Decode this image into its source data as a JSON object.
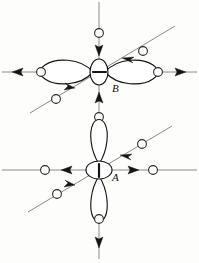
{
  "figure": {
    "background_color": "#fdfdfc",
    "width": 199,
    "height": 263,
    "line_color": "#8a8a8a",
    "ink_color": "#151515",
    "node_fill": "#fdfdfc"
  },
  "atoms": [
    {
      "id": "B",
      "label": "B",
      "label_x": 112,
      "label_y": 92,
      "center_x": 99,
      "center_y": 72,
      "orbital_orientation": "horizontal",
      "core_ellipse_rx": 9,
      "core_ellipse_ry": 13
    },
    {
      "id": "A",
      "label": "A",
      "label_x": 112,
      "label_y": 181,
      "center_x": 99,
      "center_y": 170,
      "orbital_orientation": "vertical",
      "core_ellipse_rx": 13,
      "core_ellipse_ry": 9
    }
  ],
  "axes": [
    {
      "atom": "B",
      "name": "horizontal-axis",
      "x1": 2,
      "y1": 72,
      "x2": 197,
      "y2": 72
    },
    {
      "atom": "B",
      "name": "vertical-axis",
      "x1": 99,
      "y1": 2,
      "x2": 99,
      "y2": 133
    },
    {
      "atom": "B",
      "name": "diagonal-axis",
      "x1": 30,
      "y1": 113,
      "x2": 175,
      "y2": 26
    },
    {
      "atom": "A",
      "name": "horizontal-axis",
      "x1": 2,
      "y1": 170,
      "x2": 197,
      "y2": 170
    },
    {
      "atom": "A",
      "name": "vertical-axis",
      "x1": 99,
      "y1": 126,
      "x2": 99,
      "y2": 259
    },
    {
      "atom": "A",
      "name": "diagonal-axis",
      "x1": 28,
      "y1": 212,
      "x2": 172,
      "y2": 126
    }
  ],
  "arrows": [
    {
      "atom": "B",
      "name": "arrow-left-outward",
      "direction": "left",
      "sense": "outward",
      "tip_x": 12,
      "tip_y": 72,
      "angle_deg": 180
    },
    {
      "atom": "B",
      "name": "arrow-right-outward",
      "direction": "right",
      "sense": "outward",
      "tip_x": 186,
      "tip_y": 72,
      "angle_deg": 0
    },
    {
      "atom": "B",
      "name": "arrow-top-inward",
      "direction": "down",
      "sense": "inward",
      "tip_x": 99,
      "tip_y": 56,
      "angle_deg": 90
    },
    {
      "atom": "B",
      "name": "arrow-bottom-inward",
      "direction": "up",
      "sense": "inward",
      "tip_x": 99,
      "tip_y": 92,
      "angle_deg": 270
    },
    {
      "atom": "B",
      "name": "arrow-diagonal-ne-inward",
      "direction": "down-left",
      "sense": "inward",
      "tip_x": 122,
      "tip_y": 58,
      "angle_deg": 211
    },
    {
      "atom": "B",
      "name": "arrow-diagonal-sw-inward",
      "direction": "up-right",
      "sense": "inward",
      "tip_x": 75,
      "tip_y": 88,
      "angle_deg": 31
    },
    {
      "atom": "A",
      "name": "arrow-left-inward",
      "direction": "right",
      "sense": "inward",
      "tip_x": 72,
      "tip_y": 170,
      "angle_deg": 0
    },
    {
      "atom": "A",
      "name": "arrow-right-inward",
      "direction": "left",
      "sense": "inward",
      "tip_x": 128,
      "tip_y": 170,
      "angle_deg": 180
    },
    {
      "atom": "A",
      "name": "arrow-bottom-outward",
      "direction": "down",
      "sense": "outward",
      "tip_x": 99,
      "tip_y": 248,
      "angle_deg": 90
    },
    {
      "atom": "A",
      "name": "arrow-diagonal-ne-inward",
      "direction": "down-left",
      "sense": "inward",
      "tip_x": 120,
      "tip_y": 155,
      "angle_deg": 211
    },
    {
      "atom": "A",
      "name": "arrow-diagonal-sw-inward",
      "direction": "up-right",
      "sense": "inward",
      "tip_x": 75,
      "tip_y": 185,
      "angle_deg": 31
    }
  ],
  "nodes": [
    {
      "atom": "B",
      "name": "node-left",
      "cx": 41,
      "cy": 72,
      "r": 4.4
    },
    {
      "atom": "B",
      "name": "node-right",
      "cx": 158,
      "cy": 72,
      "r": 4.4
    },
    {
      "atom": "B",
      "name": "node-top",
      "cx": 99,
      "cy": 33,
      "r": 4.4
    },
    {
      "atom": "B",
      "name": "node-bottom",
      "cx": 99,
      "cy": 117,
      "r": 4.4
    },
    {
      "atom": "B",
      "name": "node-diagonal-ne",
      "cx": 143,
      "cy": 51,
      "r": 4.4
    },
    {
      "atom": "B",
      "name": "node-diagonal-sw",
      "cx": 56,
      "cy": 99,
      "r": 4.4
    },
    {
      "atom": "A",
      "name": "node-left",
      "cx": 45,
      "cy": 170,
      "r": 4.4
    },
    {
      "atom": "A",
      "name": "node-right",
      "cx": 153,
      "cy": 170,
      "r": 4.4
    },
    {
      "atom": "A",
      "name": "node-bottom",
      "cx": 99,
      "cy": 219,
      "r": 4.4
    },
    {
      "atom": "A",
      "name": "node-diagonal-ne",
      "cx": 142,
      "cy": 144,
      "r": 4.4
    },
    {
      "atom": "A",
      "name": "node-diagonal-sw",
      "cx": 57,
      "cy": 194,
      "r": 4.4
    }
  ],
  "lobes": [
    {
      "atom": "B",
      "name": "lobe-left",
      "orientation": "horizontal",
      "side": "left"
    },
    {
      "atom": "B",
      "name": "lobe-right",
      "orientation": "horizontal",
      "side": "right"
    },
    {
      "atom": "A",
      "name": "lobe-top",
      "orientation": "vertical",
      "side": "top"
    },
    {
      "atom": "A",
      "name": "lobe-bottom",
      "orientation": "vertical",
      "side": "bottom"
    }
  ]
}
